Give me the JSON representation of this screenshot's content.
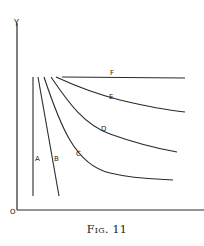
{
  "figure": {
    "caption": "Fig. 11",
    "axis_labels": {
      "y": "Y",
      "origin": "O"
    },
    "curves": [
      {
        "label": "A",
        "shape": "vertical line"
      },
      {
        "label": "B",
        "shape": "steep straight line"
      },
      {
        "label": "C",
        "shape": "steep curve flattening"
      },
      {
        "label": "D",
        "shape": "moderate curve"
      },
      {
        "label": "E",
        "shape": "gentle curve"
      },
      {
        "label": "F",
        "shape": "horizontal line"
      }
    ]
  },
  "colors": {
    "line": "#2a2a2a",
    "background": "#ffffff"
  }
}
